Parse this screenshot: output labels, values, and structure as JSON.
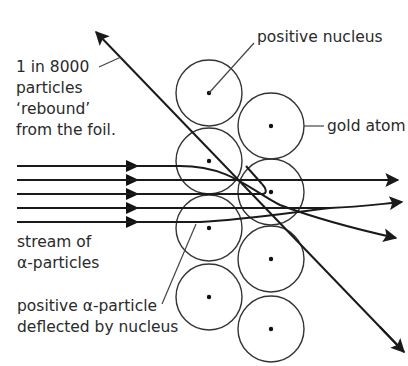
{
  "labels": {
    "rebound_line1": "1 in 8000",
    "rebound_line2": "particles",
    "rebound_line3": "‘rebound’",
    "rebound_line4": "from the foil.",
    "positive_nucleus": "positive nucleus",
    "gold_atom": "gold atom",
    "stream_line1": "stream of",
    "stream_line2": "α-particles",
    "deflected_line1": "positive α-particle",
    "deflected_line2": "deflected by nucleus"
  },
  "gold_atoms": [
    {
      "cx": 209,
      "cy": 93
    },
    {
      "cx": 209,
      "cy": 161
    },
    {
      "cx": 209,
      "cy": 228
    },
    {
      "cx": 209,
      "cy": 297
    },
    {
      "cx": 271,
      "cy": 126
    },
    {
      "cx": 271,
      "cy": 192
    },
    {
      "cx": 271,
      "cy": 259
    },
    {
      "cx": 271,
      "cy": 329
    }
  ],
  "colors": {
    "stroke": "#1a1a1a",
    "text": "#2a2a2a",
    "background": "#ffffff"
  }
}
